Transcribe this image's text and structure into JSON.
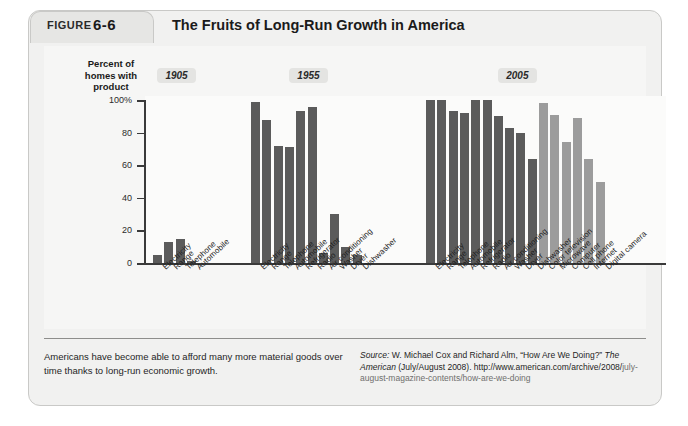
{
  "figure": {
    "tab_label": "FIGURE",
    "tab_number": "6-6",
    "title": "The Fruits of Long-Run Growth in America"
  },
  "chart_data": {
    "type": "bar",
    "title": "The Fruits of Long-Run Growth in America",
    "ylabel": "Percent of homes with product",
    "xlabel": "",
    "ylim": [
      0,
      100
    ],
    "ytick_labels": [
      "100%",
      "80",
      "60",
      "40",
      "20",
      "0"
    ],
    "ytick_values": [
      100,
      80,
      60,
      40,
      20,
      0
    ],
    "grid": false,
    "legend": "none",
    "groups": [
      {
        "name": "1905",
        "categories": [
          "Electricity",
          "Range",
          "Telephone",
          "Automobile"
        ],
        "values": [
          5,
          13,
          15,
          1
        ],
        "shades": [
          "dark",
          "dark",
          "dark",
          "dark"
        ]
      },
      {
        "name": "1955",
        "categories": [
          "Electricity",
          "Range",
          "Telephone",
          "Automobile",
          "Refrigerator",
          "Radio",
          "Air conditioning",
          "Washer",
          "Dryer",
          "Dishwasher"
        ],
        "values": [
          99,
          88,
          72,
          71,
          93,
          96,
          6,
          30,
          10,
          5
        ],
        "shades": [
          "dark",
          "dark",
          "dark",
          "dark",
          "dark",
          "dark",
          "dark",
          "dark",
          "dark",
          "dark"
        ]
      },
      {
        "name": "2005",
        "categories": [
          "Electricity",
          "Range",
          "Telephone",
          "Automobile",
          "Refrigerator",
          "Radio",
          "Air conditioning",
          "Washer",
          "Dryer",
          "Dishwasher",
          "Color television",
          "Microwave",
          "Computer",
          "Cell phone",
          "Internet",
          "Digital camera"
        ],
        "values": [
          100,
          100,
          93,
          92,
          100,
          100,
          90,
          83,
          80,
          64,
          98,
          91,
          74,
          89,
          64,
          50
        ],
        "shades": [
          "dark",
          "dark",
          "dark",
          "dark",
          "dark",
          "dark",
          "dark",
          "dark",
          "dark",
          "dark",
          "light",
          "light",
          "light",
          "light",
          "light",
          "light"
        ]
      }
    ],
    "colors": {
      "bar_dark": "#5b5b5b",
      "bar_light": "#9c9c9c",
      "axis": "#3a3a3a",
      "panel": "#f6f6f5",
      "frame": "#f1f1f0"
    }
  },
  "footer": {
    "note": "Americans have become able to afford many more material goods over time thanks to long-run economic growth.",
    "source_label": "Source:",
    "source_text_1": " W. Michael Cox and Richard Alm, “How Are We Doing?” ",
    "source_italic_1": "The American",
    "source_text_2": " (July/August 2008). http://www.american.com/archive/2008/",
    "source_text_3": "july-august-magazine-contents/how-are-we-doing"
  }
}
